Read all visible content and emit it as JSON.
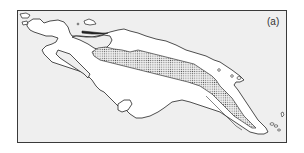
{
  "figure": {
    "panel_label": "(a)",
    "colors": {
      "frame_border": "#3a3a3a",
      "sea": "#efefef",
      "land": "#ffffff",
      "coastline": "#222222",
      "stipple_dot": "#555555"
    },
    "legend": {
      "stippled_region": "highland zone"
    }
  }
}
